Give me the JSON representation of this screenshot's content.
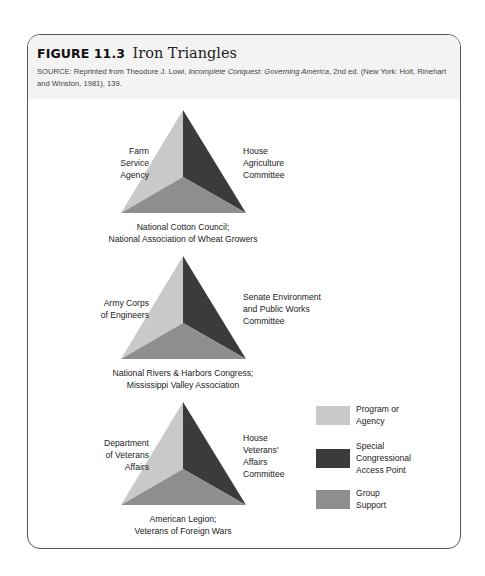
{
  "figure": {
    "number": "FIGURE 11.3",
    "title": "Iron Triangles",
    "source_prefix": "SOURCE: Reprinted from Theodore J. Lowi, ",
    "source_title": "Incomplete Conquest: Governing America",
    "source_suffix": ", 2nd ed. (New York: Holt, Rinehart and Winston, 1981), 139."
  },
  "colors": {
    "agency": "#c9c9c9",
    "congress": "#3b3b3b",
    "group": "#8e8e8e",
    "header_bg": "#f3f3f3",
    "frame_border": "#555555"
  },
  "triangles": [
    {
      "agency": [
        "Farm",
        "Service",
        "Agency"
      ],
      "congress": [
        "House",
        "Agriculture",
        "Committee"
      ],
      "group": [
        "National Cotton Council;",
        "National Association of Wheat Growers"
      ]
    },
    {
      "agency": [
        "Army Corps",
        "of Engineers"
      ],
      "congress": [
        "Senate Environment",
        "and Public Works",
        "Committee"
      ],
      "group": [
        "National Rivers & Harbors Congress;",
        "Mississippi Valley Association"
      ]
    },
    {
      "agency": [
        "Department",
        "of Veterans",
        "Affairs"
      ],
      "congress": [
        "House",
        "Veterans'",
        "Affairs",
        "Committee"
      ],
      "group": [
        "American Legion;",
        "Veterans of Foreign Wars"
      ]
    }
  ],
  "legend": [
    {
      "key": "agency",
      "lines": [
        "Program or",
        "Agency"
      ]
    },
    {
      "key": "congress",
      "lines": [
        "Special",
        "Congressional",
        "Access Point"
      ]
    },
    {
      "key": "group",
      "lines": [
        "Group",
        "Support"
      ]
    }
  ]
}
